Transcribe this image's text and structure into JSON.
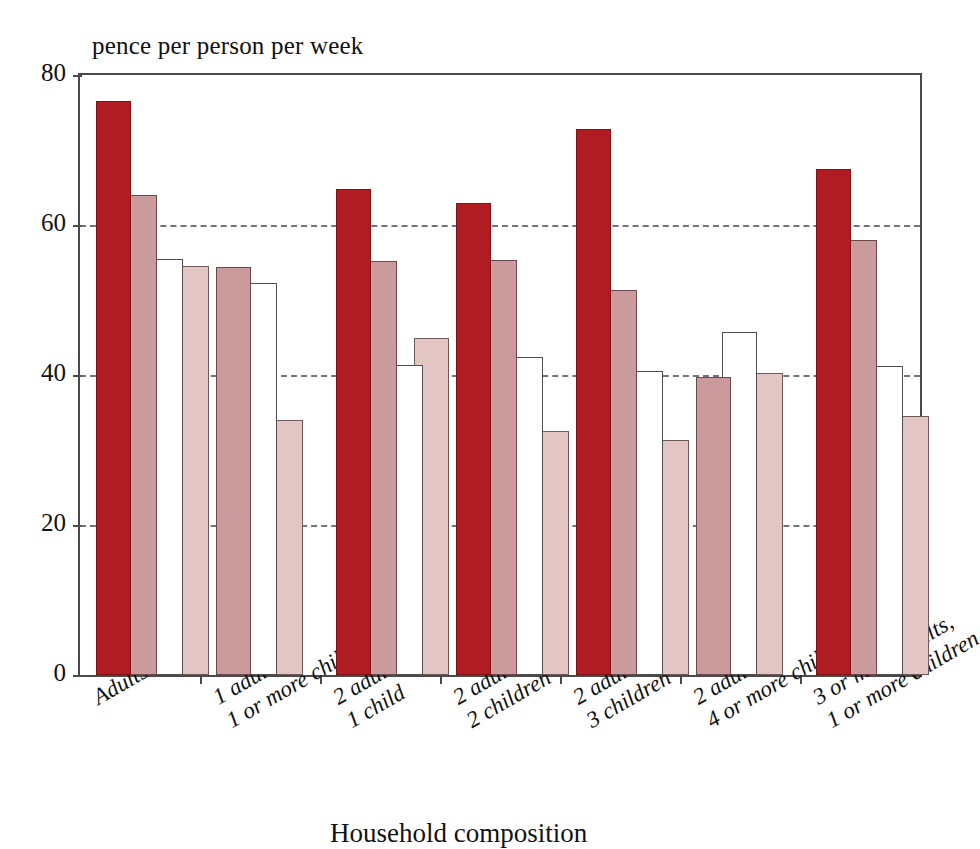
{
  "chart_data": {
    "type": "bar",
    "title": "pence per person per week",
    "xlabel": "Household composition",
    "ylabel": "",
    "ylim": [
      0,
      80
    ],
    "yticks": [
      0,
      20,
      40,
      60,
      80
    ],
    "grid": "horizontal-dashed",
    "legend": "none",
    "categories": [
      "Adults only",
      "1 adult,\n1 or more children",
      "2 adults,\n1 child",
      "2 adults,\n2 children",
      "2 adults,\n3 children",
      "2 adults,\n4 or more children",
      "3 or more adults,\n1 or more children"
    ],
    "category_lines": [
      [
        "Adults only",
        ""
      ],
      [
        "1 adult,",
        "1 or more children"
      ],
      [
        "2 adults,",
        "1 child"
      ],
      [
        "2 adults,",
        "2 children"
      ],
      [
        "2 adults,",
        "3 children"
      ],
      [
        "2 adults,",
        "4 or more children"
      ],
      [
        "3 or more adults,",
        "1 or more children"
      ]
    ],
    "series": [
      {
        "name": "series-1",
        "color": "#b01c22",
        "values": [
          76.5,
          null,
          64.8,
          63.0,
          72.8,
          null,
          67.5
        ]
      },
      {
        "name": "series-2",
        "color": "#ca9a9c",
        "values": [
          64.0,
          54.4,
          55.2,
          55.4,
          51.4,
          39.7,
          58.0
        ]
      },
      {
        "name": "series-3",
        "color": "#ffffff",
        "values": [
          55.5,
          52.3,
          41.4,
          42.4,
          40.6,
          45.7,
          41.2
        ]
      },
      {
        "name": "series-4",
        "color": "#e3c5c3",
        "values": [
          54.6,
          34.0,
          44.9,
          32.5,
          31.3,
          40.3,
          34.6
        ]
      }
    ]
  }
}
